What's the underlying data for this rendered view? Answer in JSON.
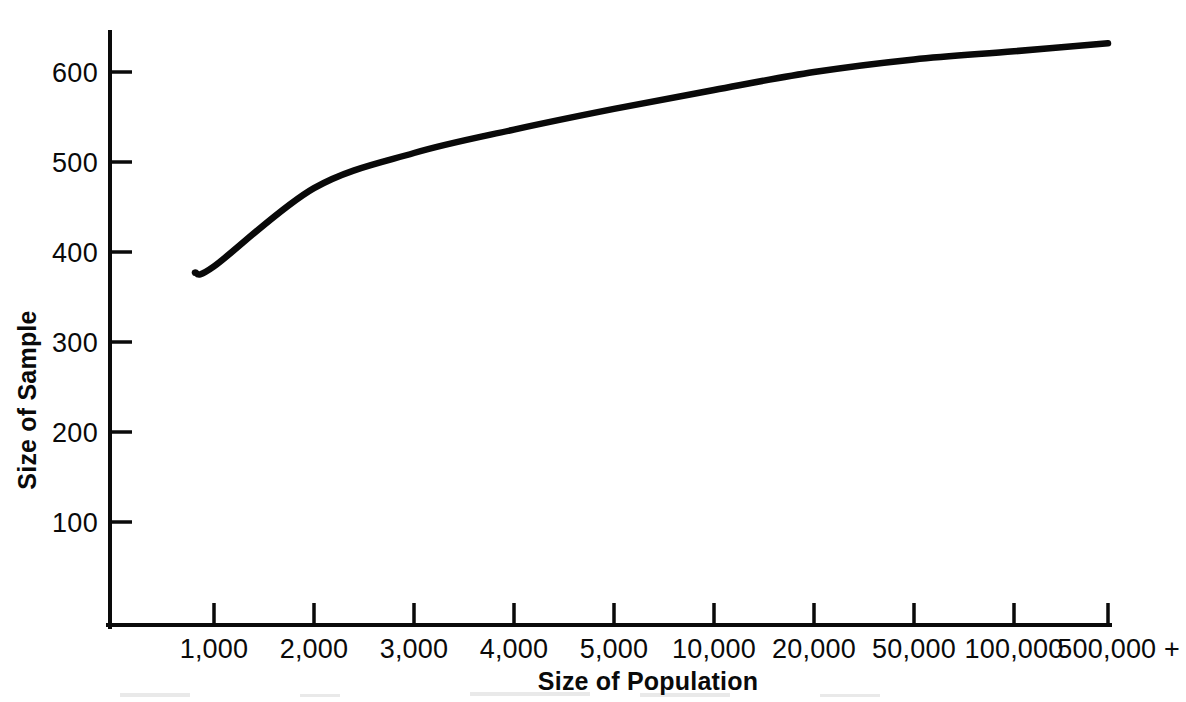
{
  "figure": {
    "background_color": "#ffffff",
    "ink_color": "#0a0a0a"
  },
  "axes": {
    "y_title": "Size of Sample",
    "x_title": "Size of Population"
  },
  "chart_data": {
    "type": "line",
    "title": "",
    "subtitle": "",
    "xlabel": "Size of Population",
    "ylabel": "Size of Sample",
    "grid": false,
    "legend": false,
    "legend_position": "none",
    "x_scale": "categorical-ordinal",
    "x_tick_labels": [
      "1,000",
      "2,000",
      "3,000",
      "4,000",
      "5,000",
      "10,000",
      "20,000",
      "50,000",
      "100,000",
      "500,000 +"
    ],
    "x_tick_values": [
      1000,
      2000,
      3000,
      4000,
      5000,
      10000,
      20000,
      50000,
      100000,
      500000
    ],
    "y_tick_labels": [
      "100",
      "200",
      "300",
      "400",
      "500",
      "600"
    ],
    "y_tick_values": [
      100,
      200,
      300,
      400,
      500,
      600
    ],
    "ylim": [
      0,
      660
    ],
    "series": [
      {
        "name": "Required sample size",
        "x": [
          "1,000",
          "2,000",
          "3,000",
          "4,000",
          "5,000",
          "10,000",
          "20,000",
          "50,000",
          "100,000",
          "500,000 +"
        ],
        "values": [
          384,
          471,
          510,
          536,
          559,
          580,
          600,
          614,
          623,
          632
        ]
      }
    ],
    "curve_left_edge_value": 377,
    "annotations": []
  },
  "ytick_labels": [
    "600",
    "500",
    "400",
    "300",
    "200",
    "100"
  ],
  "xtick_labels": [
    "1,000",
    "2,000",
    "3,000",
    "4,000",
    "5,000",
    "10,000",
    "20,000",
    "50,000",
    "100,000",
    "500,000 +"
  ]
}
